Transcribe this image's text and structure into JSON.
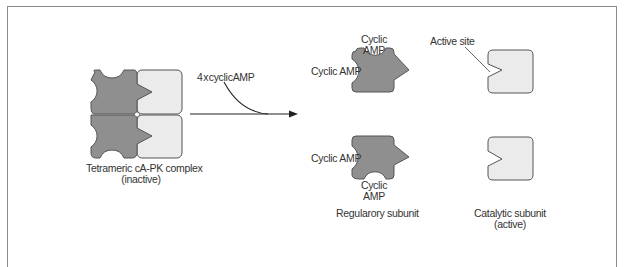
{
  "diagram": {
    "colors": {
      "regulatory_fill": "#8f8f8f",
      "catalytic_fill": "#ebebeb",
      "outline": "#555555",
      "frame": "#8a8a8a",
      "text": "#333333"
    },
    "complex": {
      "label_line1": "Tetrameric cA-PK complex",
      "label_line2": "(inactive)"
    },
    "arrow": {
      "label": "4 x cyclic AMP"
    },
    "regulatory": {
      "top": {
        "camp_top_line1": "Cyclic",
        "camp_top_line2": "AMP",
        "camp_left": "Cyclic AMP"
      },
      "bottom": {
        "camp_left": "Cyclic AMP",
        "camp_bottom_line1": "Cyclic",
        "camp_bottom_line2": "AMP"
      },
      "label": "Regularory subunit"
    },
    "catalytic": {
      "active_site_label": "Active site",
      "label_line1": "Catalytic subunit",
      "label_line2": "(active)"
    }
  }
}
